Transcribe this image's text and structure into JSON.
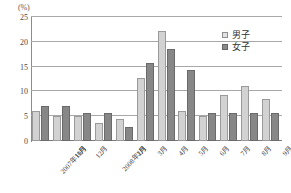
{
  "chart_data": {
    "type": "bar",
    "title": "",
    "xlabel": "",
    "ylabel": "(%)",
    "unit_label": "(%)",
    "ylim": [
      0,
      25
    ],
    "yticks": [
      0,
      5,
      10,
      15,
      20,
      25
    ],
    "ytick_labels": [
      "0",
      "5",
      "10",
      "15",
      "20",
      "25"
    ],
    "grid": true,
    "grid_axis": "y",
    "legend_position": "top-right",
    "categories": [
      "2007年10月",
      "11月",
      "12月",
      "2008年1月",
      "2月",
      "3月",
      "4月",
      "5月",
      "6月",
      "7月",
      "8月",
      "9月"
    ],
    "series": [
      {
        "name": "男子",
        "color": "#d2d2d2",
        "values": [
          6.1,
          5.0,
          5.0,
          3.6,
          4.4,
          12.8,
          22.2,
          6.1,
          5.0,
          9.3,
          11.1,
          8.5
        ]
      },
      {
        "name": "女子",
        "color": "#878787",
        "values": [
          7.1,
          7.1,
          5.7,
          5.7,
          2.8,
          15.7,
          18.5,
          14.3,
          5.7,
          5.7,
          5.7,
          5.7
        ]
      }
    ]
  },
  "legend": {
    "items": [
      {
        "label": "男子",
        "swatch": "male"
      },
      {
        "label": "女子",
        "swatch": "female"
      }
    ]
  },
  "colors": {
    "male_bar": "#d2d2d2",
    "female_bar": "#878787",
    "gridline": "#a8a8a8",
    "axis": "#8c8c8c",
    "text": "#3f3f3f",
    "background": "#ffffff"
  }
}
